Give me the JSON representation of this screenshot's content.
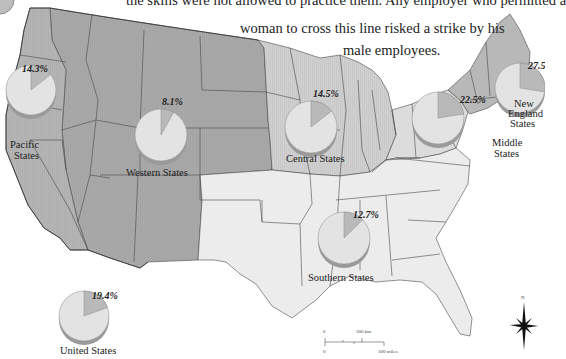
{
  "caption": {
    "line1": "the skills were not allowed to practice them. Any employer who permitted a",
    "line2": "woman to cross this line risked a strike by his",
    "line3": "male employees."
  },
  "colors": {
    "western_fill": "#a9a9a9",
    "pacific_fill": "#b5b5b5",
    "central_fill": "#d0d0d0",
    "southern_fill": "#ececec",
    "middle_fill": "#dcdcdc",
    "newengland_fill": "#b8b8b8",
    "border": "#4a4a4a",
    "pie_main": "#e3e3e3",
    "pie_slice": "#b9b9b9",
    "pie_edge": "#9a9a9a"
  },
  "regions": [
    {
      "id": "pacific",
      "label_lines": [
        "Pacific",
        "States"
      ],
      "percent": 14.3,
      "percent_label": "14.3%"
    },
    {
      "id": "western",
      "label_lines": [
        "Western States"
      ],
      "percent": 8.1,
      "percent_label": "8.1%"
    },
    {
      "id": "central",
      "label_lines": [
        "Central States"
      ],
      "percent": 14.5,
      "percent_label": "14.5%"
    },
    {
      "id": "middle",
      "label_lines": [
        "Middle",
        "States"
      ],
      "percent": 22.5,
      "percent_label": "22.5%"
    },
    {
      "id": "newengland",
      "label_lines": [
        "New",
        "England",
        "States"
      ],
      "percent": 27.5,
      "percent_label": "27.5%"
    },
    {
      "id": "southern",
      "label_lines": [
        "Southern States"
      ],
      "percent": 12.7,
      "percent_label": "12.7%"
    },
    {
      "id": "us",
      "label_lines": [
        "United States"
      ],
      "percent": 19.4,
      "percent_label": "19.4%"
    }
  ],
  "scale": {
    "km_zero": "0",
    "km_label": "300 km",
    "mi_zero": "0",
    "mi_label": "300 miles"
  },
  "compass": {
    "north_label": "N"
  }
}
